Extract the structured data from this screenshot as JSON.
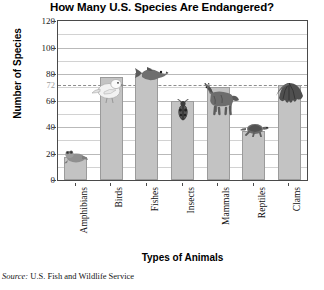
{
  "chart_data": {
    "type": "bar",
    "title": "How Many U.S. Species Are Endangered?",
    "xlabel": "Types of Animals",
    "ylabel": "Number of Species",
    "categories": [
      "Amphibians",
      "Birds",
      "Fishes",
      "Insects",
      "Mammals",
      "Reptiles",
      "Clams"
    ],
    "values": [
      17,
      78,
      81,
      60,
      70,
      37,
      72
    ],
    "ylim": [
      0,
      120
    ],
    "yticks": [
      0,
      20,
      40,
      60,
      80,
      100,
      120
    ],
    "ytick_labels": [
      "0",
      "20",
      "40",
      "60",
      "80",
      "100",
      "120"
    ],
    "minor_gridlines": [
      10,
      30,
      50,
      70,
      90,
      110
    ],
    "grid": true,
    "legend": "none",
    "annotations": [
      {
        "type": "reference-line",
        "value": 72,
        "label": "72",
        "style": "dashed",
        "color": "#8d8d8d"
      }
    ],
    "bar_color": "#c3c3c3",
    "bar_edge_color": "#9b9b9b",
    "icons": [
      {
        "category": "Amphibians",
        "name": "frog-icon"
      },
      {
        "category": "Birds",
        "name": "bird-icon"
      },
      {
        "category": "Fishes",
        "name": "fish-icon"
      },
      {
        "category": "Insects",
        "name": "beetle-icon"
      },
      {
        "category": "Mammals",
        "name": "horse-icon"
      },
      {
        "category": "Reptiles",
        "name": "turtle-icon"
      },
      {
        "category": "Clams",
        "name": "clam-icon"
      }
    ]
  },
  "source": {
    "prefix": "Source:",
    "text": "U.S. Fish and Wildlife Service"
  }
}
